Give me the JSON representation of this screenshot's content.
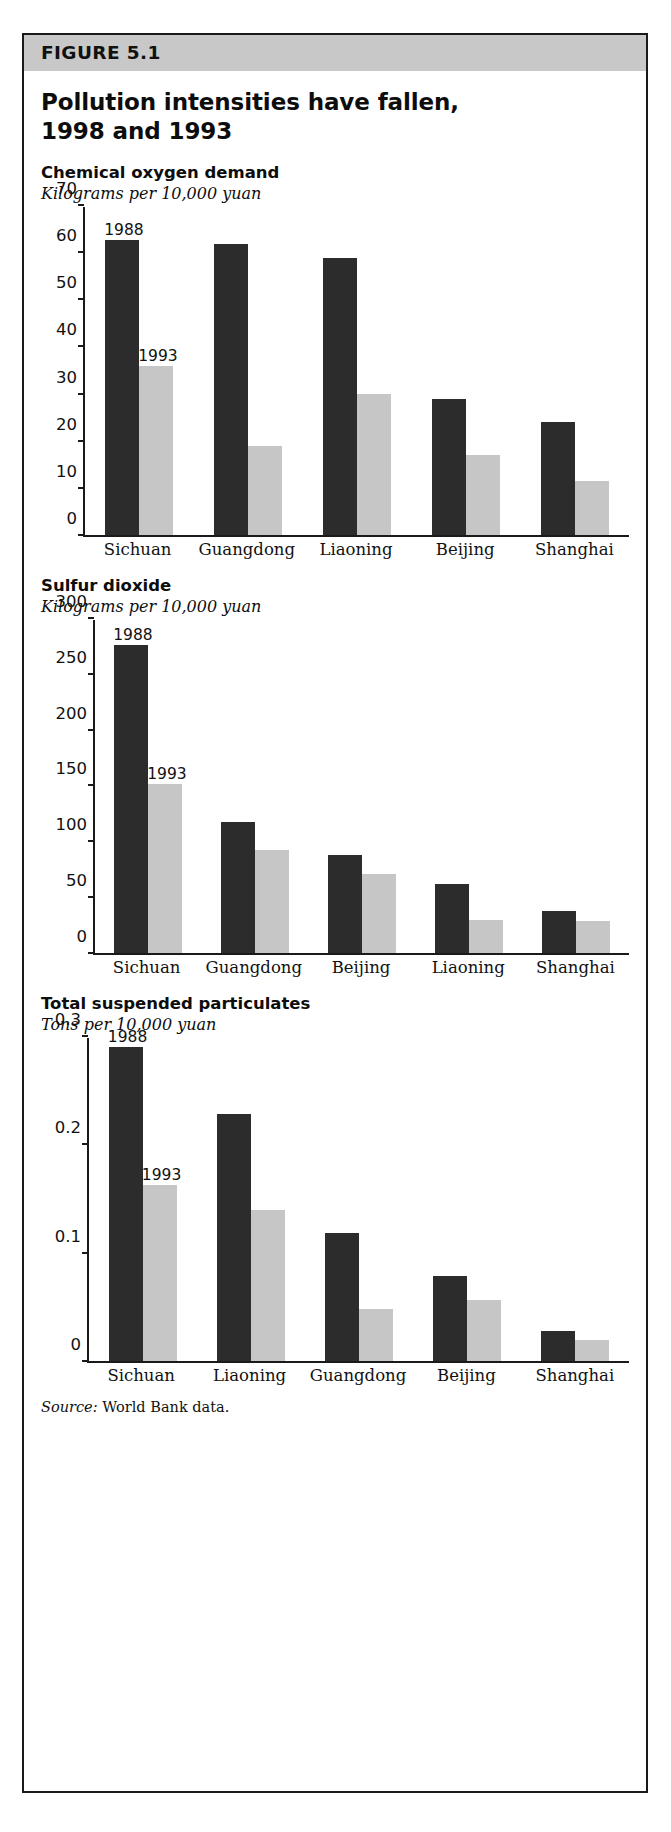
{
  "figure": {
    "band_label": "FIGURE 5.1",
    "title": "Pollution intensities have fallen, 1998 and 1993",
    "source_prefix": "Source:",
    "source_text": "World Bank data.",
    "accent_band_color": "#c8c8c8",
    "series_dark_color": "#2c2c2c",
    "series_light_color": "#c6c6c6"
  },
  "chart_data": [
    {
      "type": "bar",
      "title": "Chemical oxygen demand",
      "subtitle": "Kilograms per 10,000 yuan",
      "xlabel": "",
      "ylabel": "Kilograms per 10,000 yuan",
      "ylim": [
        0,
        70
      ],
      "yticks": [
        0,
        10,
        20,
        30,
        40,
        50,
        60,
        70
      ],
      "ytick_labels": [
        "0",
        "10",
        "20",
        "30",
        "40",
        "50",
        "60",
        "70"
      ],
      "grid": false,
      "legend_position": "inline-annotation",
      "annotations": [
        "1988",
        "1993"
      ],
      "categories": [
        "Sichuan",
        "Guangdong",
        "Liaoning",
        "Beijing",
        "Shanghai"
      ],
      "series": [
        {
          "name": "1988",
          "values": [
            63,
            62,
            59,
            29,
            24
          ]
        },
        {
          "name": "1993",
          "values": [
            36,
            19,
            30,
            17,
            11.5
          ]
        }
      ]
    },
    {
      "type": "bar",
      "title": "Sulfur dioxide",
      "subtitle": "Kilograms per 10,000 yuan",
      "xlabel": "",
      "ylabel": "Kilograms per 10,000 yuan",
      "ylim": [
        0,
        300
      ],
      "yticks": [
        0,
        50,
        100,
        150,
        200,
        250,
        300
      ],
      "ytick_labels": [
        "0",
        "50",
        "100",
        "150",
        "200",
        "250",
        "300"
      ],
      "grid": false,
      "legend_position": "inline-annotation",
      "annotations": [
        "1988",
        "1993"
      ],
      "categories": [
        "Sichuan",
        "Guangdong",
        "Beijing",
        "Liaoning",
        "Shanghai"
      ],
      "series": [
        {
          "name": "1988",
          "values": [
            277,
            118,
            88,
            62,
            38
          ]
        },
        {
          "name": "1993",
          "values": [
            152,
            93,
            71,
            30,
            29
          ]
        }
      ]
    },
    {
      "type": "bar",
      "title": "Total suspended particulates",
      "subtitle": "Tons per 10,000 yuan",
      "xlabel": "",
      "ylabel": "Tons per 10,000 yuan",
      "ylim": [
        0,
        0.3
      ],
      "yticks": [
        0,
        0.1,
        0.2,
        0.3
      ],
      "ytick_labels": [
        "0",
        "0.1",
        "0.2",
        "0.3"
      ],
      "grid": false,
      "legend_position": "inline-annotation",
      "annotations": [
        "1988",
        "1993"
      ],
      "categories": [
        "Sichuan",
        "Liaoning",
        "Guangdong",
        "Beijing",
        "Shanghai"
      ],
      "series": [
        {
          "name": "1988",
          "values": [
            0.292,
            0.229,
            0.119,
            0.079,
            0.028
          ]
        },
        {
          "name": "1993",
          "values": [
            0.163,
            0.14,
            0.048,
            0.057,
            0.019
          ]
        }
      ]
    }
  ]
}
